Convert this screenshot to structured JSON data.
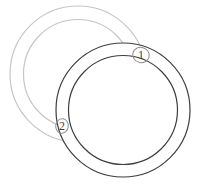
{
  "figure": {
    "background_color": "#ffffff",
    "rings": [
      {
        "id": "ring-upper-left",
        "center_x": 78,
        "center_y": 74,
        "outer_radius": 68,
        "inner_radius": 54.5,
        "stroke_color": "#c6c6c6",
        "occlusion": "passes behind dark ring"
      },
      {
        "id": "ring-lower-right",
        "center_x": 123,
        "center_y": 110,
        "outer_radius": 67,
        "inner_radius": 54.5,
        "stroke_color": "#3e3e3e",
        "fill_color": "#ffffff",
        "occlusion": "drawn on top"
      }
    ],
    "markers": [
      {
        "label": "1",
        "cx": 141,
        "cy": 55,
        "rx": 8.3,
        "ry": 7.6,
        "stroke_color": "#8f8f8f",
        "text_color": "#3e3e3e"
      },
      {
        "label": "2",
        "cx": 62,
        "cy": 126,
        "rx": 6.3,
        "ry": 7.2,
        "stroke_color": "#8f8f8f",
        "text_color": "#3e3e3e"
      }
    ]
  }
}
